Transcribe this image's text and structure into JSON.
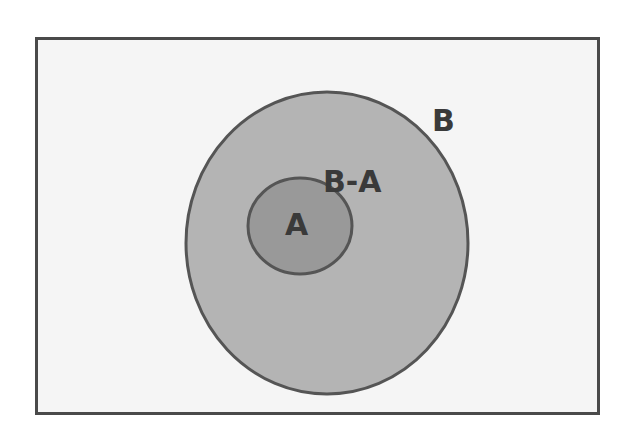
{
  "diagram": {
    "type": "venn-subset",
    "title": "",
    "sets": [
      {
        "id": "B",
        "label": "B",
        "fill": "#b4b4b4",
        "stroke": "#555555"
      },
      {
        "id": "A",
        "label": "A",
        "fill": "#999999",
        "stroke": "#555555",
        "subset_of": "B"
      }
    ],
    "region_labels": {
      "outer_set": "B",
      "difference": "B-A",
      "inner_set": "A"
    },
    "colors": {
      "background": "#f5f5f5",
      "border": "#4a4a4a",
      "text": "#3a3a3a"
    }
  }
}
